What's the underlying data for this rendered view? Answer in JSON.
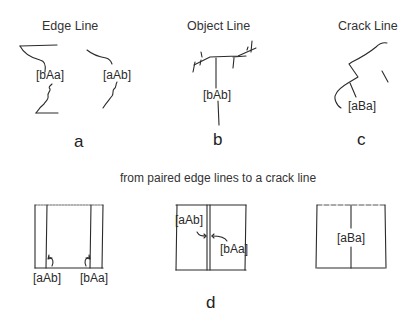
{
  "figure": {
    "panel_a": {
      "title": "Edge Line",
      "labels": [
        "[bAa]",
        "[aAb]"
      ],
      "letter": "a"
    },
    "panel_b": {
      "title": "Object Line",
      "labels": [
        "[bAb]"
      ],
      "letter": "b"
    },
    "panel_c": {
      "title": "Crack Line",
      "labels": [
        "[aBa]"
      ],
      "letter": "c"
    },
    "panel_d": {
      "caption": "from paired edge lines to a crack line",
      "left_labels": [
        "[aAb]",
        "[bAa]"
      ],
      "middle_labels": [
        "[aAb]",
        "[bAa]"
      ],
      "right_labels": [
        "[aBa]"
      ],
      "letter": "d"
    },
    "stroke_color": "#2a2a2a",
    "background_color": "#ffffff"
  }
}
